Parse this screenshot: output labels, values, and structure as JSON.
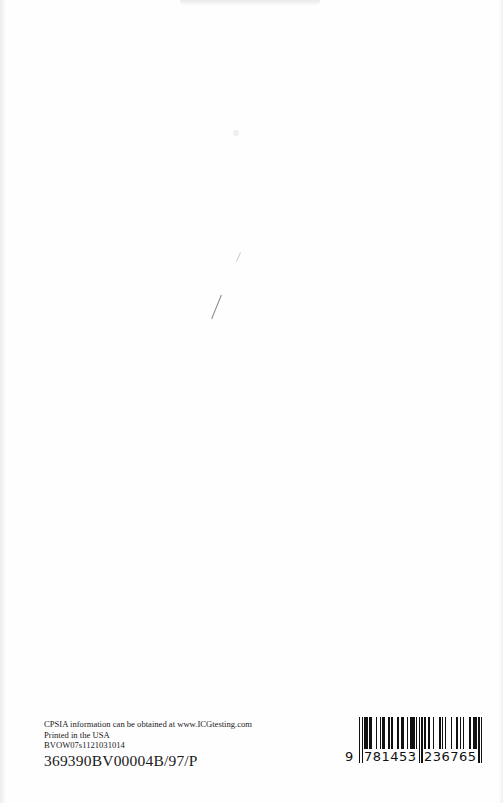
{
  "page": {
    "background": "#fefefe"
  },
  "imprint": {
    "lines": [
      "CPSIA information can be obtained at www.ICGtesting.com",
      "Printed in the USA",
      "BVOW07s1121031014"
    ],
    "code": "369390BV00004B/97/P"
  },
  "barcode": {
    "type": "EAN-13 (ISBN)",
    "digits": "9781453236765",
    "first_digit": "9",
    "left_group": "781453",
    "right_group": "236765"
  }
}
